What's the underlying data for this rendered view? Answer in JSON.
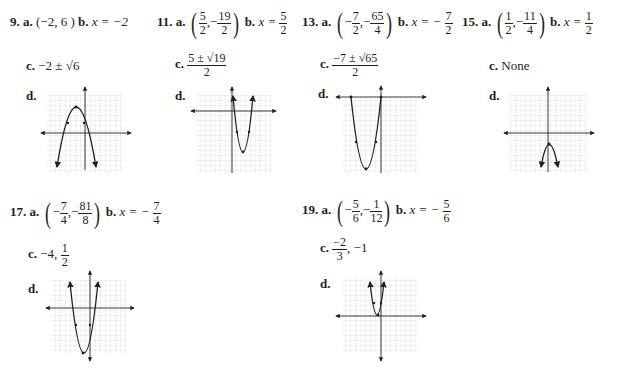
{
  "problems": [
    {
      "number": "9.",
      "a_label": "a.",
      "a_value": "(−2, 6 )",
      "b_label": "b.",
      "b_value": "x = −2",
      "c_label": "c.",
      "c_value": "−2 ± √6",
      "d_label": "d."
    },
    {
      "number": "11.",
      "a_label": "a.",
      "a_x_num": "5",
      "a_x_den": "2",
      "a_y_num": "19",
      "a_y_den": "2",
      "b_label": "b.",
      "b_prefix": "x =",
      "b_num": "5",
      "b_den": "2",
      "c_label": "c.",
      "c_num": "5 ± √19",
      "c_den": "2",
      "d_label": "d."
    },
    {
      "number": "13.",
      "a_label": "a.",
      "a_x_num": "7",
      "a_x_den": "2",
      "a_y_num": "65",
      "a_y_den": "4",
      "b_label": "b.",
      "b_prefix": "x = −",
      "b_num": "7",
      "b_den": "2",
      "c_label": "c.",
      "c_num": "−7 ± √65",
      "c_den": "2",
      "d_label": "d."
    },
    {
      "number": "15.",
      "a_label": "a.",
      "a_x_num": "1",
      "a_x_den": "2",
      "a_y_num": "11",
      "a_y_den": "4",
      "b_label": "b.",
      "b_prefix": "x =",
      "b_num": "1",
      "b_den": "2",
      "c_label": "c.",
      "c_value": "None",
      "d_label": "d."
    },
    {
      "number": "17.",
      "a_label": "a.",
      "a_x_num": "7",
      "a_x_den": "4",
      "a_y_num": "81",
      "a_y_den": "8",
      "b_label": "b.",
      "b_prefix": "x = −",
      "b_num": "7",
      "b_den": "4",
      "c_label": "c.",
      "c_prefix": "−4,",
      "c_num": "1",
      "c_den": "2",
      "d_label": "d."
    },
    {
      "number": "19.",
      "a_label": "a.",
      "a_x_num": "5",
      "a_x_den": "6",
      "a_y_num": "1",
      "a_y_den": "12",
      "b_label": "b.",
      "b_prefix": "x = −",
      "b_num": "5",
      "b_den": "6",
      "c_label": "c.",
      "c_num": "−2",
      "c_den": "3",
      "c_suffix": ", −1",
      "d_label": "d."
    }
  ],
  "signs": {
    "minus": "−",
    "comma": ","
  },
  "parens": {
    "open": "(",
    "close": ")"
  }
}
